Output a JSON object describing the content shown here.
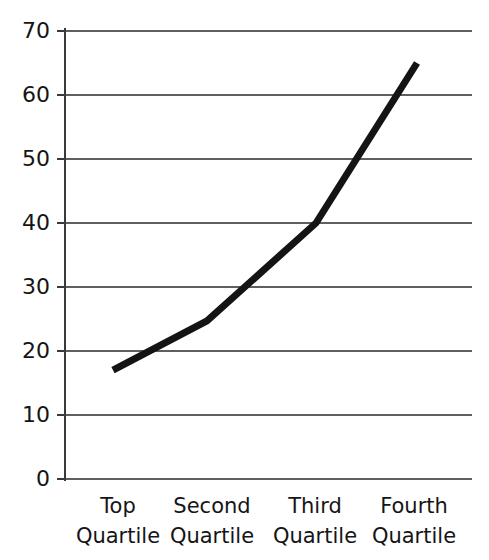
{
  "chart_data": {
    "type": "line",
    "title": "",
    "subtitle": "",
    "xlabel": "",
    "ylabel": "",
    "categories": [
      "Top Quartile",
      "Second Quartile",
      "Third Quartile",
      "Fourth Quartile"
    ],
    "category_lines": [
      [
        "Top",
        "Quartile"
      ],
      [
        "Second",
        "Quartile"
      ],
      [
        "Third",
        "Quartile"
      ],
      [
        "Fourth",
        "Quartile"
      ]
    ],
    "values": [
      17,
      24.7,
      40,
      65
    ],
    "series": [
      {
        "name": "",
        "values": [
          17,
          24.7,
          40,
          65
        ]
      }
    ],
    "ylim": [
      0,
      70
    ],
    "ytick_values": [
      0,
      10,
      20,
      30,
      40,
      50,
      60,
      70
    ],
    "ytick_labels": [
      "0",
      "10",
      "20",
      "30",
      "40",
      "50",
      "60",
      "70"
    ],
    "grid": true,
    "grid_axis": "y",
    "legend": false,
    "legend_position": "none",
    "annotations": [],
    "colors": {
      "line": "#141414",
      "gridline": "#5f5f5f",
      "axis": "#3a3a3a",
      "text": "#151515",
      "background": "#ffffff"
    }
  },
  "axis": {
    "y_labels": {
      "t70": "70",
      "t60": "60",
      "t50": "50",
      "t40": "40",
      "t30": "30",
      "t20": "20",
      "t10": "10",
      "t0": "0"
    },
    "x_labels": {
      "c0_line1": "Top",
      "c0_line2": "Quartile",
      "c1_line1": "Second",
      "c1_line2": "Quartile",
      "c2_line1": "Third",
      "c2_line2": "Quartile",
      "c3_line1": "Fourth",
      "c3_line2": "Quartile"
    }
  }
}
